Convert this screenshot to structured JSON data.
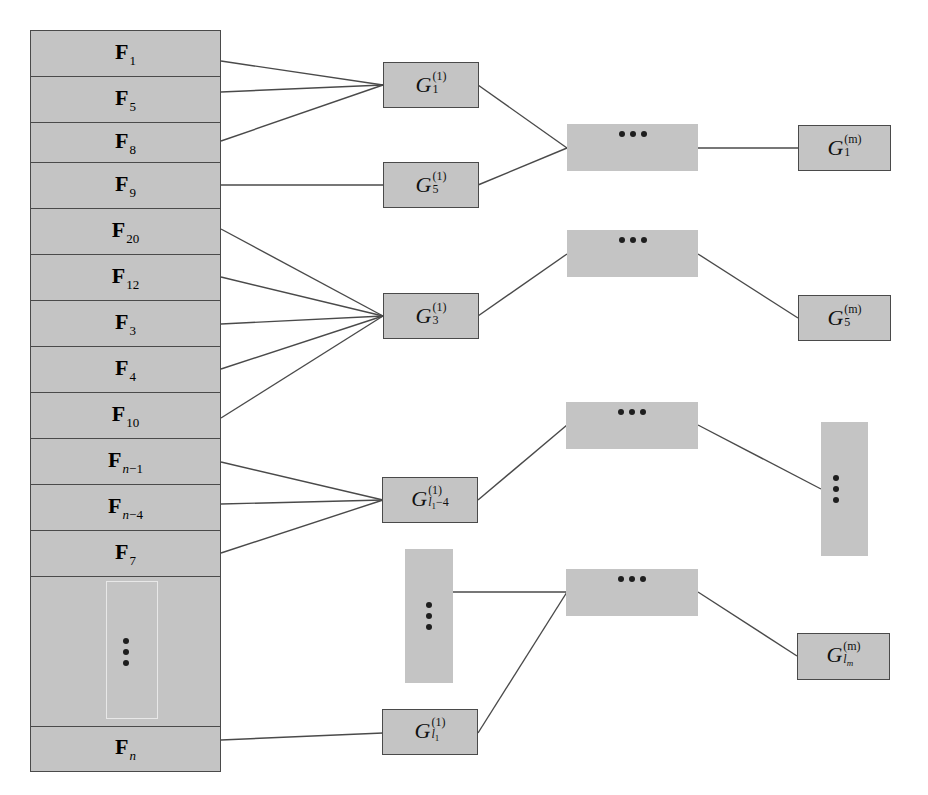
{
  "diagram": {
    "type": "feature-grouping hierarchy",
    "colors": {
      "box_fill": "#c4c4c4",
      "box_border": "#4a4a4a",
      "line": "#4a4a4a",
      "dots": "#1e1e1e"
    },
    "feature_column": {
      "rows": [
        {
          "id": "F1",
          "base": "F",
          "sub": "1"
        },
        {
          "id": "F5",
          "base": "F",
          "sub": "5"
        },
        {
          "id": "F8",
          "base": "F",
          "sub": "8"
        },
        {
          "id": "F9",
          "base": "F",
          "sub": "9"
        },
        {
          "id": "F20",
          "base": "F",
          "sub": "20"
        },
        {
          "id": "F12",
          "base": "F",
          "sub": "12"
        },
        {
          "id": "F3",
          "base": "F",
          "sub": "3"
        },
        {
          "id": "F4",
          "base": "F",
          "sub": "4"
        },
        {
          "id": "F10",
          "base": "F",
          "sub": "10"
        },
        {
          "id": "Fn-1",
          "base": "F",
          "sub_var": "n",
          "sub_rest": "−1"
        },
        {
          "id": "Fn-4",
          "base": "F",
          "sub_var": "n",
          "sub_rest": "−4"
        },
        {
          "id": "F7",
          "base": "F",
          "sub": "7"
        },
        {
          "id": "ellipsis",
          "ellipsis": "vertical"
        },
        {
          "id": "Fn",
          "base": "F",
          "sub_var": "n",
          "sub_rest": ""
        }
      ]
    },
    "level1": [
      {
        "id": "G1_1",
        "base": "G",
        "sup": "(1)",
        "sub": "1",
        "inputs": [
          "F1",
          "F5",
          "F8"
        ]
      },
      {
        "id": "G5_1",
        "base": "G",
        "sup": "(1)",
        "sub": "5",
        "inputs": [
          "F9"
        ]
      },
      {
        "id": "G3_1",
        "base": "G",
        "sup": "(1)",
        "sub": "3",
        "inputs": [
          "F20",
          "F12",
          "F3",
          "F4",
          "F10"
        ]
      },
      {
        "id": "Gl1-4_1",
        "base": "G",
        "sup": "(1)",
        "sub_var": "l",
        "sub_var_sub": "1",
        "sub_rest": "−4",
        "inputs": [
          "Fn-1",
          "Fn-4",
          "F7"
        ]
      },
      {
        "id": "ellipsis_1",
        "ellipsis": "vertical"
      },
      {
        "id": "Gl1_1",
        "base": "G",
        "sup": "(1)",
        "sub_var": "l",
        "sub_var_sub": "1",
        "sub_rest": "",
        "inputs": [
          "Fn"
        ]
      }
    ],
    "intermediate": [
      {
        "id": "mid_a",
        "ellipsis": "horizontal",
        "inputs": [
          "G1_1",
          "G5_1"
        ]
      },
      {
        "id": "mid_b",
        "ellipsis": "horizontal",
        "inputs": [
          "G3_1"
        ]
      },
      {
        "id": "mid_c",
        "ellipsis": "horizontal",
        "inputs": [
          "Gl1-4_1"
        ]
      },
      {
        "id": "mid_d",
        "ellipsis": "horizontal",
        "inputs": [
          "ellipsis_1",
          "Gl1_1"
        ]
      }
    ],
    "levelm": [
      {
        "id": "G1_m",
        "base": "G",
        "sup": "(m)",
        "sub": "1",
        "inputs": [
          "mid_a"
        ]
      },
      {
        "id": "G5_m",
        "base": "G",
        "sup": "(m)",
        "sub": "5",
        "inputs": [
          "mid_b"
        ]
      },
      {
        "id": "ellipsis_m",
        "ellipsis": "vertical",
        "inputs": [
          "mid_c"
        ]
      },
      {
        "id": "Glm_m",
        "base": "G",
        "sup": "(m)",
        "sub_var": "l",
        "sub_var_sub": "m",
        "inputs": [
          "mid_d"
        ]
      }
    ]
  }
}
